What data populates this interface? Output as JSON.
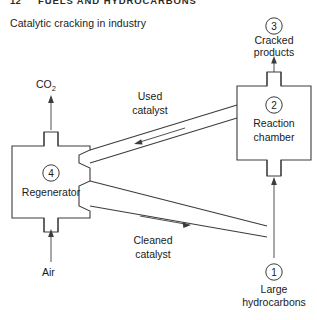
{
  "page": {
    "width": 317,
    "height": 320,
    "background": "#ffffff",
    "ink": "#3c3c3c",
    "text_color": "#1a1a1a"
  },
  "running_header": {
    "chapter_number": "12",
    "chapter_title": "FUELS AND HYDROCARBONS"
  },
  "caption": "Catalytic cracking in industry",
  "diagram": {
    "type": "process-flow",
    "title": "Catalytic cracking in industry",
    "nodes": [
      {
        "id": "1",
        "marker": "1",
        "label_line1": "Large",
        "label_line2": "hydrocarbons",
        "kind": "inlet-stream"
      },
      {
        "id": "2",
        "marker": "2",
        "label_line1": "Reaction",
        "label_line2": "chamber",
        "kind": "vessel"
      },
      {
        "id": "3",
        "marker": "3",
        "label_line1": "Cracked",
        "label_line2": "products",
        "kind": "outlet-stream"
      },
      {
        "id": "4",
        "marker": "4",
        "label_line1": "Regenerator",
        "label_line2": "",
        "kind": "vessel"
      }
    ],
    "streams": [
      {
        "id": "used-catalyst",
        "label_line1": "Used",
        "label_line2": "catalyst",
        "from": "2",
        "to": "4",
        "direction": "right-to-left"
      },
      {
        "id": "cleaned-catalyst",
        "label_line1": "Cleaned",
        "label_line2": "catalyst",
        "from": "4",
        "to": "2",
        "direction": "left-to-right"
      },
      {
        "id": "co2-outlet",
        "label": "CO",
        "label_subscript": "2",
        "from": "4",
        "to": "atmosphere",
        "direction": "up"
      },
      {
        "id": "air-inlet",
        "label": "Air",
        "from": "atmosphere",
        "to": "4",
        "direction": "up"
      }
    ]
  }
}
